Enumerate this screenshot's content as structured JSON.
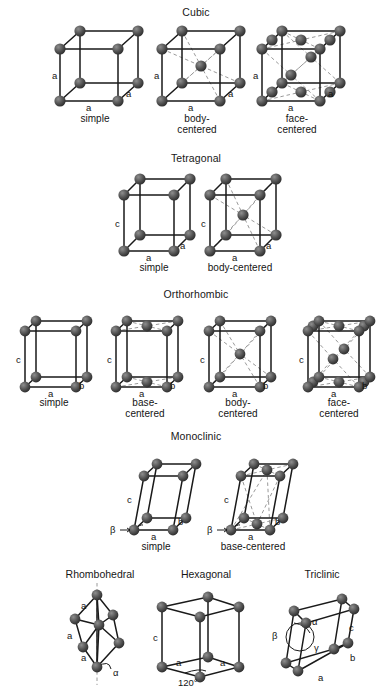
{
  "figure": {
    "kind": "crystal-lattice-bravais-diagram",
    "background_color": "#ffffff",
    "atom_color": "#4a4a4a",
    "edge_color": "#1a1a1a",
    "hidden_edge_color": "#9a9a9a",
    "label_color": "#141414"
  },
  "groups": [
    {
      "id": "cubic",
      "title": "Cubic",
      "cells": [
        {
          "id": "cubic-simple",
          "caption": [
            "simple"
          ],
          "edge_labels": [
            "a",
            "a",
            "a"
          ]
        },
        {
          "id": "cubic-body-centered",
          "caption": [
            "body-",
            "centered"
          ],
          "edge_labels": [
            "a",
            "a",
            "a"
          ]
        },
        {
          "id": "cubic-face-centered",
          "caption": [
            "face-",
            "centered"
          ],
          "edge_labels": [
            "a",
            "a",
            "a"
          ]
        }
      ]
    },
    {
      "id": "tetragonal",
      "title": "Tetragonal",
      "cells": [
        {
          "id": "tetragonal-simple",
          "caption": [
            "simple"
          ],
          "edge_labels": [
            "c",
            "a",
            "a"
          ]
        },
        {
          "id": "tetragonal-body-centered",
          "caption": [
            "body-centered"
          ],
          "edge_labels": [
            "c",
            "a",
            "a"
          ]
        }
      ]
    },
    {
      "id": "orthorhombic",
      "title": "Orthorhombic",
      "cells": [
        {
          "id": "orthorhombic-simple",
          "caption": [
            "simple"
          ],
          "edge_labels": [
            "c",
            "a",
            "b"
          ]
        },
        {
          "id": "orthorhombic-base-centered",
          "caption": [
            "base-",
            "centered"
          ],
          "edge_labels": [
            "c",
            "a",
            "b"
          ]
        },
        {
          "id": "orthorhombic-body-centered",
          "caption": [
            "body-",
            "centered"
          ],
          "edge_labels": [
            "c",
            "a",
            "b"
          ]
        },
        {
          "id": "orthorhombic-face-centered",
          "caption": [
            "face-",
            "centered"
          ],
          "edge_labels": [
            "c",
            "a",
            "b"
          ]
        }
      ]
    },
    {
      "id": "monoclinic",
      "title": "Monoclinic",
      "cells": [
        {
          "id": "monoclinic-simple",
          "caption": [
            "simple"
          ],
          "edge_labels": [
            "c",
            "a",
            "b"
          ],
          "angle_labels": [
            "β"
          ]
        },
        {
          "id": "monoclinic-base-centered",
          "caption": [
            "base-centered"
          ],
          "edge_labels": [
            "c",
            "a",
            "b"
          ],
          "angle_labels": [
            "β"
          ]
        }
      ]
    },
    {
      "id": "bottom-row",
      "title": "",
      "cells": [
        {
          "id": "rhombohedral",
          "caption": [],
          "heading": "Rhombohedral",
          "edge_labels": [
            "a",
            "a",
            "a"
          ],
          "angle_labels": [
            "α"
          ]
        },
        {
          "id": "hexagonal",
          "caption": [],
          "heading": "Hexagonal",
          "edge_labels": [
            "c",
            "a",
            "a"
          ],
          "angle_labels": [
            "120°"
          ]
        },
        {
          "id": "triclinic",
          "caption": [],
          "heading": "Triclinic",
          "edge_labels": [
            "c",
            "a",
            "b"
          ],
          "angle_labels": [
            "α",
            "β",
            "γ"
          ]
        }
      ]
    }
  ],
  "labels": {
    "a": "a",
    "b": "b",
    "c": "c",
    "alpha": "α",
    "beta": "β",
    "gamma": "γ",
    "angle120": "120°",
    "simple": "simple",
    "body_1": "body-",
    "body_2": "centered",
    "face_1": "face-",
    "face_2": "centered",
    "base_1": "base-",
    "base_2": "centered",
    "body_centered_inline": "body-centered",
    "base_centered_inline": "base-centered"
  },
  "titles": {
    "cubic": "Cubic",
    "tetragonal": "Tetragonal",
    "orthorhombic": "Orthorhombic",
    "monoclinic": "Monoclinic",
    "rhombohedral": "Rhombohedral",
    "hexagonal": "Hexagonal",
    "triclinic": "Triclinic"
  }
}
